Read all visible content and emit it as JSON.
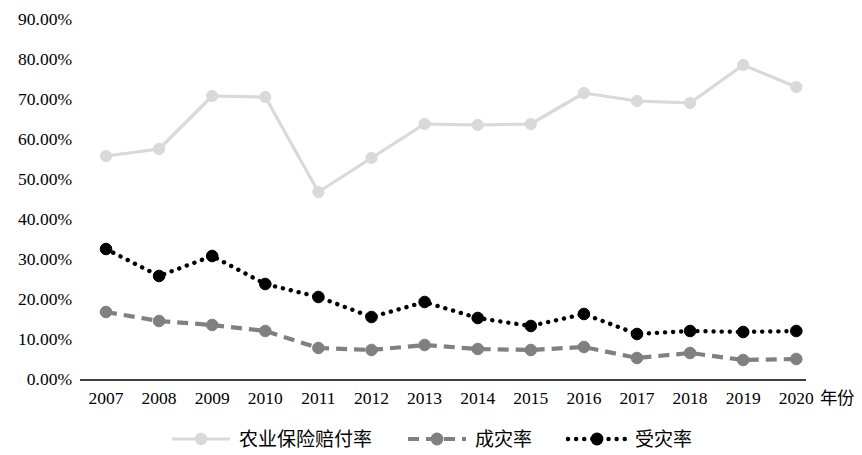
{
  "chart_data": {
    "type": "line",
    "title": "",
    "subtitle": "",
    "xlabel": "年份",
    "ylabel": "",
    "grid": false,
    "legend_position": "bottom",
    "categories": [
      "2007",
      "2008",
      "2009",
      "2010",
      "2011",
      "2012",
      "2013",
      "2014",
      "2015",
      "2016",
      "2017",
      "2018",
      "2019",
      "2020"
    ],
    "x": [
      2007,
      2008,
      2009,
      2010,
      2011,
      2012,
      2013,
      2014,
      2015,
      2016,
      2017,
      2018,
      2019,
      2020
    ],
    "ylim": [
      0,
      90
    ],
    "ytick_labels": [
      "90.00%",
      "80.00%",
      "70.00%",
      "60.00%",
      "50.00%",
      "40.00%",
      "30.00%",
      "20.00%",
      "10.00%",
      "0.00%"
    ],
    "ytick_values": [
      90,
      80,
      70,
      60,
      50,
      40,
      30,
      20,
      10,
      0
    ],
    "series": [
      {
        "name": "农业保险赔付率",
        "color": "#d9d9d9",
        "style": "solid",
        "marker": "circle",
        "values": [
          56.0,
          57.75,
          71.0,
          70.75,
          47.0,
          55.5,
          64.0,
          63.75,
          64.0,
          71.75,
          69.75,
          69.25,
          78.75,
          73.25
        ]
      },
      {
        "name": "成灾率",
        "color": "#808080",
        "style": "dashed",
        "marker": "circle",
        "values": [
          17.0,
          14.75,
          13.75,
          12.25,
          8.0,
          7.5,
          8.75,
          7.75,
          7.5,
          8.25,
          5.5,
          6.75,
          5.0,
          5.25
        ]
      },
      {
        "name": "受灾率",
        "color": "#000000",
        "style": "dotted",
        "marker": "circle",
        "values": [
          32.75,
          26.0,
          31.0,
          24.0,
          20.75,
          15.75,
          19.5,
          15.5,
          13.5,
          16.5,
          11.5,
          12.25,
          12.0,
          12.25
        ]
      }
    ]
  },
  "axis": {
    "x_name": "年份",
    "baseline_color": "#404040"
  },
  "legend": {
    "items": [
      {
        "label": "农业保险赔付率",
        "color": "#d9d9d9",
        "style": "solid"
      },
      {
        "label": "成灾率",
        "color": "#808080",
        "style": "dashed"
      },
      {
        "label": "受灾率",
        "color": "#000000",
        "style": "dotted"
      }
    ]
  }
}
